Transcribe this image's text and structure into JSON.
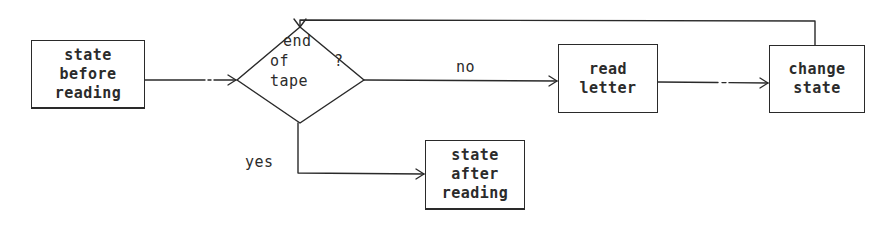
{
  "diagram": {
    "type": "flowchart",
    "colors": {
      "stroke": "#2a2a2a",
      "text": "#2b2b2b",
      "background": "#ffffff"
    },
    "nodes": {
      "start": {
        "shape": "rectangle",
        "lines": [
          "state",
          "before",
          "reading"
        ]
      },
      "decision": {
        "shape": "diamond",
        "lines": [
          "end",
          "of",
          "tape"
        ],
        "question_mark": "?"
      },
      "read": {
        "shape": "rectangle",
        "lines": [
          "read",
          "letter"
        ]
      },
      "change": {
        "shape": "rectangle",
        "lines": [
          "change",
          "state"
        ]
      },
      "end": {
        "shape": "rectangle",
        "lines": [
          "state",
          "after",
          "reading"
        ]
      }
    },
    "edges": [
      {
        "from": "start",
        "to": "decision",
        "label": ""
      },
      {
        "from": "decision",
        "to": "read",
        "label": "no"
      },
      {
        "from": "read",
        "to": "change",
        "label": ""
      },
      {
        "from": "change",
        "to": "decision",
        "label": ""
      },
      {
        "from": "decision",
        "to": "end",
        "label": "yes"
      }
    ],
    "edge_labels": {
      "no": "no",
      "yes": "yes"
    }
  }
}
